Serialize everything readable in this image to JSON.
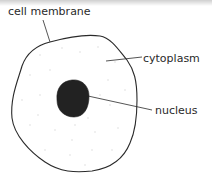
{
  "diagram": {
    "type": "animal-cell",
    "labels": {
      "membrane": "cell membrane",
      "cytoplasm": "cytoplasm",
      "nucleus": "nucleus"
    },
    "colors": {
      "outline": "#2a2a2a",
      "nucleus_fill": "#222222",
      "cytoplasm_dots": "#d8d8d8",
      "background": "#ffffff"
    }
  }
}
